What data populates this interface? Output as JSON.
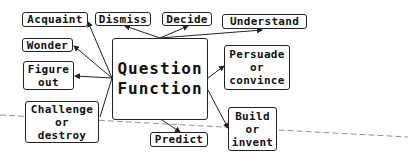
{
  "diagram": {
    "center": {
      "line1": "Question",
      "line2": "Function"
    },
    "nodes": [
      {
        "id": "acquaint",
        "lines": [
          "Acquaint"
        ]
      },
      {
        "id": "dismiss",
        "lines": [
          "Dismiss"
        ]
      },
      {
        "id": "decide",
        "lines": [
          "Decide"
        ]
      },
      {
        "id": "understand",
        "lines": [
          "Understand"
        ]
      },
      {
        "id": "wonder",
        "lines": [
          "Wonder"
        ]
      },
      {
        "id": "figure-out",
        "lines": [
          "Figure",
          "out"
        ]
      },
      {
        "id": "persuade",
        "lines": [
          "Persuade",
          "or",
          "convince"
        ]
      },
      {
        "id": "challenge",
        "lines": [
          "Challenge",
          "or",
          "destroy"
        ]
      },
      {
        "id": "predict",
        "lines": [
          "Predict"
        ]
      },
      {
        "id": "build",
        "lines": [
          "Build",
          "or",
          "invent"
        ]
      }
    ]
  }
}
